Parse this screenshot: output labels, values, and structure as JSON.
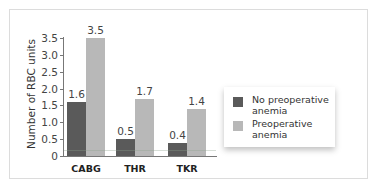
{
  "chart_data": {
    "type": "bar",
    "title": "",
    "xlabel": "",
    "ylabel": "Number of RBC units",
    "ylim": [
      0,
      3.5
    ],
    "yticks": [
      "0",
      "0.5",
      "1.0",
      "1.5",
      "2.0",
      "2.5",
      "3.0",
      "3.5"
    ],
    "categories": [
      "CABG",
      "THR",
      "TKR"
    ],
    "series": [
      {
        "name": "No preoperative anemia",
        "color": "#5a5a5a",
        "values": [
          1.6,
          0.5,
          0.4
        ],
        "labels": [
          "1.6",
          "0.5",
          "0.4"
        ]
      },
      {
        "name": "Preoperative anemia",
        "color": "#b8b8b8",
        "values": [
          3.5,
          1.7,
          1.4
        ],
        "labels": [
          "3.5",
          "1.7",
          "1.4"
        ]
      }
    ],
    "legend_position": "right",
    "grid": false
  }
}
